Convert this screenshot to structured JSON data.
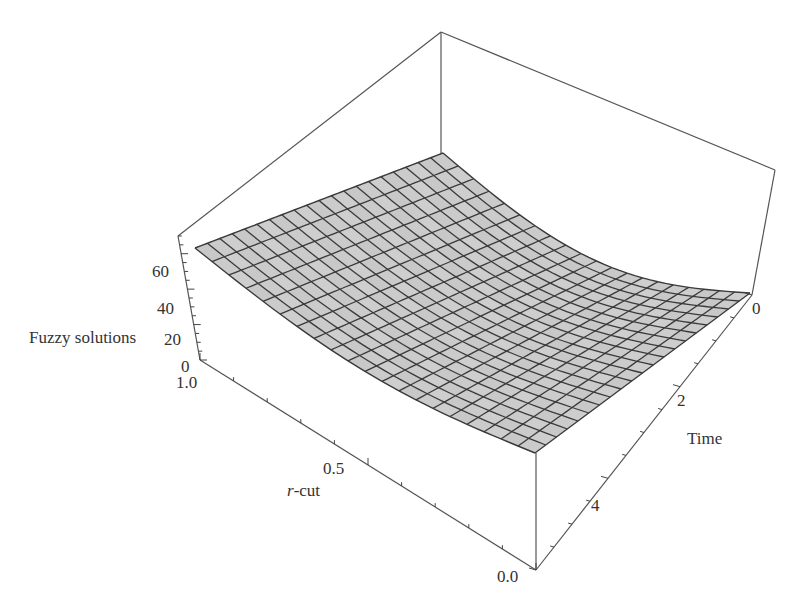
{
  "chart_data": {
    "type": "surface3d",
    "title": "",
    "zlabel": "Fuzzy solutions",
    "xlabel": "r-cut",
    "xlabel_italic_prefix": "r",
    "xlabel_suffix": "-cut",
    "ylabel": "Time",
    "x_axis": {
      "name": "r-cut",
      "range": [
        0.0,
        1.0
      ],
      "ticks": [
        "1.0",
        "0.5",
        "0.0"
      ]
    },
    "y_axis": {
      "name": "Time",
      "range": [
        0,
        6
      ],
      "ticks": [
        "0",
        "2",
        "4"
      ]
    },
    "z_axis": {
      "name": "Fuzzy solutions",
      "range": [
        0,
        70
      ],
      "ticks": [
        "0",
        "20",
        "40",
        "60"
      ]
    },
    "grid_lines": {
      "x": 20,
      "y": 20
    },
    "surface_description": "Gray mesh surface; highest (~65) at r-cut=1.0, Time=0 (left corner), curving down toward ~0 along the Time axis; near-flat at low r-cut",
    "surface_samples": [
      {
        "r": 1.0,
        "t": 0,
        "z": 65
      },
      {
        "r": 0.0,
        "t": 0,
        "z": 62
      },
      {
        "r": 1.0,
        "t": 6,
        "z": 5
      },
      {
        "r": 0.0,
        "t": 6,
        "z": 3
      }
    ],
    "colors": {
      "surface": "#c8c8c8",
      "mesh": "#333333",
      "box": "#555555"
    }
  },
  "labels": {
    "z_title": "Fuzzy solutions",
    "z_ticks": [
      "0",
      "20",
      "40",
      "60"
    ],
    "r_ticks": [
      "1.0",
      "0.5",
      "0.0"
    ],
    "r_title_italic": "r",
    "r_title_rest": "-cut",
    "t_ticks": [
      "0",
      "2",
      "4"
    ],
    "t_title": "Time"
  }
}
